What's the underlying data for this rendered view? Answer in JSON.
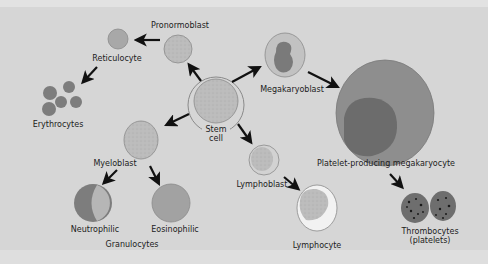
{
  "diagram": {
    "colors": {
      "background": "#d6d6d6",
      "cell_fill": "#b8b8b8",
      "cell_outline": "#8a8a8a",
      "dark_cell": "#7a7a7a",
      "nucleus": "#6a6a6a",
      "arrow": "#111111",
      "text": "#1c1c1c"
    },
    "labels": {
      "pronormoblast": "Pronormoblast",
      "reticulocyte": "Reticulocyte",
      "erythrocytes": "Erythrocytes",
      "stem_cell_line1": "Stem",
      "stem_cell_line2": "cell",
      "megakaryoblast": "Megakaryoblast",
      "platelet_producing": "Platelet-producing megakaryocyte",
      "myeloblast": "Myeloblast",
      "neutrophilic": "Neutrophilic",
      "eosinophilic": "Eosinophilic",
      "granulocytes": "Granulocytes",
      "lymphoblast": "Lymphoblast",
      "lymphocyte": "Lymphocyte",
      "thrombocytes_line1": "Thrombocytes",
      "thrombocytes_line2": "(platelets)"
    }
  }
}
